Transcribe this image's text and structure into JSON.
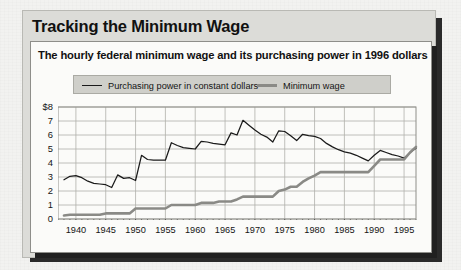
{
  "figure": {
    "title": "Tracking the Minimum Wage",
    "subtitle": "The hourly federal minimum wage and its purchasing power in 1996 dollars"
  },
  "colors": {
    "purchasing_power_line": "#1a1a1a",
    "minimum_wage_line": "#8a8a86",
    "frame": "#dcdcd8",
    "panel": "#fbfbf9",
    "legend_box": "#cfcfca",
    "gridline": "#b0b0ab",
    "shadow": "#2a2a2a"
  },
  "chart_data": {
    "type": "line",
    "title": "Tracking the Minimum Wage",
    "subtitle": "The hourly federal minimum wage and its purchasing power in 1996 dollars",
    "xlabel": "",
    "ylabel": "",
    "xlim": [
      1937,
      1997
    ],
    "ylim": [
      0,
      8
    ],
    "y_tick_labels": [
      "$8",
      "7",
      "6",
      "5",
      "4",
      "3",
      "2",
      "1",
      "0"
    ],
    "y_ticks": [
      8,
      7,
      6,
      5,
      4,
      3,
      2,
      1,
      0
    ],
    "x_ticks": [
      1940,
      1945,
      1950,
      1955,
      1960,
      1965,
      1970,
      1975,
      1980,
      1985,
      1990,
      1995
    ],
    "x_tick_labels": [
      "1940",
      "1945",
      "1950",
      "1955",
      "1960",
      "1965",
      "1970",
      "1975",
      "1980",
      "1985",
      "1990",
      "1995"
    ],
    "x_minor_tick_interval": 1,
    "grid": "horizontal",
    "legend_position": "top",
    "series": [
      {
        "name": "Purchasing power in constant dollars",
        "style": "thin-dark",
        "x": [
          1938,
          1939,
          1940,
          1941,
          1942,
          1943,
          1944,
          1945,
          1946,
          1947,
          1948,
          1949,
          1950,
          1951,
          1952,
          1953,
          1954,
          1955,
          1956,
          1957,
          1958,
          1959,
          1960,
          1961,
          1962,
          1963,
          1964,
          1965,
          1966,
          1967,
          1968,
          1969,
          1970,
          1971,
          1972,
          1973,
          1974,
          1975,
          1976,
          1977,
          1978,
          1979,
          1980,
          1981,
          1982,
          1983,
          1984,
          1985,
          1986,
          1987,
          1988,
          1989,
          1990,
          1991,
          1992,
          1993,
          1994,
          1995,
          1996,
          1997
        ],
        "y": [
          2.8,
          3.05,
          3.1,
          2.95,
          2.7,
          2.55,
          2.5,
          2.45,
          2.25,
          3.15,
          2.9,
          2.95,
          2.75,
          4.55,
          4.25,
          4.2,
          4.2,
          4.2,
          5.45,
          5.25,
          5.1,
          5.05,
          5.0,
          5.55,
          5.5,
          5.4,
          5.35,
          5.3,
          6.15,
          6.0,
          7.05,
          6.7,
          6.35,
          6.05,
          5.85,
          5.5,
          6.3,
          6.25,
          5.95,
          5.6,
          6.05,
          5.95,
          5.9,
          5.75,
          5.4,
          5.15,
          4.95,
          4.8,
          4.7,
          4.55,
          4.35,
          4.15,
          4.55,
          4.9,
          4.75,
          4.6,
          4.5,
          4.35,
          4.75,
          5.05
        ]
      },
      {
        "name": "Minimum wage",
        "style": "thick-gray",
        "x": [
          1938,
          1939,
          1940,
          1941,
          1942,
          1943,
          1944,
          1945,
          1946,
          1947,
          1948,
          1949,
          1950,
          1951,
          1952,
          1953,
          1954,
          1955,
          1956,
          1957,
          1958,
          1959,
          1960,
          1961,
          1962,
          1963,
          1964,
          1965,
          1966,
          1967,
          1968,
          1969,
          1970,
          1971,
          1972,
          1973,
          1974,
          1975,
          1976,
          1977,
          1978,
          1979,
          1980,
          1981,
          1982,
          1983,
          1984,
          1985,
          1986,
          1987,
          1988,
          1989,
          1990,
          1991,
          1992,
          1993,
          1994,
          1995,
          1996,
          1997
        ],
        "y": [
          0.25,
          0.3,
          0.3,
          0.3,
          0.3,
          0.3,
          0.3,
          0.4,
          0.4,
          0.4,
          0.4,
          0.4,
          0.75,
          0.75,
          0.75,
          0.75,
          0.75,
          0.75,
          1.0,
          1.0,
          1.0,
          1.0,
          1.0,
          1.15,
          1.15,
          1.15,
          1.25,
          1.25,
          1.25,
          1.4,
          1.6,
          1.6,
          1.6,
          1.6,
          1.6,
          1.6,
          2.0,
          2.1,
          2.3,
          2.3,
          2.65,
          2.9,
          3.1,
          3.35,
          3.35,
          3.35,
          3.35,
          3.35,
          3.35,
          3.35,
          3.35,
          3.35,
          3.8,
          4.25,
          4.25,
          4.25,
          4.25,
          4.25,
          4.75,
          5.15
        ]
      }
    ]
  }
}
